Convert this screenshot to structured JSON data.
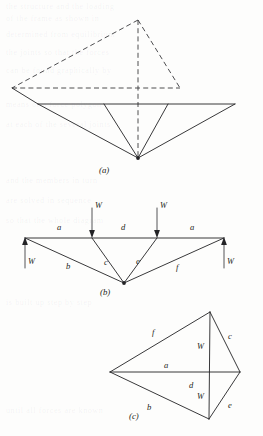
{
  "figure": {
    "panels": [
      {
        "id": "a",
        "caption": "(a)",
        "description": "Isometric view of space frame: dashed upper triangular frame and solid lower inverted pyramid"
      },
      {
        "id": "b",
        "caption": "(b)",
        "description": "Elevation of truss with member labels and applied loads"
      },
      {
        "id": "c",
        "caption": "(c)",
        "description": "Maxwell force diagram (reciprocal figure)"
      }
    ],
    "members": {
      "a": "a",
      "b": "b",
      "c": "c",
      "d": "d",
      "e": "e",
      "f": "f"
    },
    "loads": {
      "w": "W"
    },
    "panel_b": {
      "top_left_member": "a",
      "top_mid_member": "d",
      "top_right_member": "a",
      "lower_left_member": "b",
      "lower_mid_left_member": "c",
      "lower_mid_right_member": "e",
      "lower_right_member": "f",
      "load_left_down": "W",
      "load_right_down": "W",
      "reaction_left_up": "W",
      "reaction_right_up": "W"
    },
    "panel_c": {
      "upper_left_member": "f",
      "upper_right_member": "c",
      "mid_upper_member": "a",
      "mid_lower_member": "d",
      "lower_left_member": "b",
      "lower_right_member": "e",
      "upper_load": "W",
      "lower_load": "W"
    },
    "colors": {
      "ink": "#232326",
      "dashed_ink": "#3a3a3d",
      "paper": "#fdfdfc"
    },
    "ghost_text": [
      "the structure  and  the  loading",
      "of  the  frame  as  shown  in",
      "determined  from  equilibrium",
      "the  joints  so  that  the  forces",
      "can  be  found  graphically  by",
      "means  of  a  force  polygon",
      "at  each  of  the  several  joints",
      "and  the  members  in  turn",
      "are  solved  in  sequence",
      "so  that  the  whole  diagram",
      "is  built  up  step  by  step",
      "until  all  forces  are  known"
    ]
  }
}
